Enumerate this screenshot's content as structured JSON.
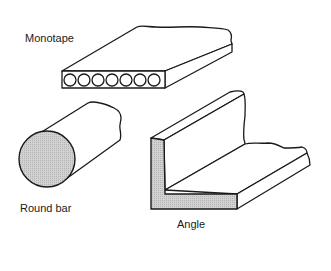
{
  "figure": {
    "items": [
      {
        "id": "monotape",
        "label": "Monotape",
        "tube_count": 7
      },
      {
        "id": "round-bar",
        "label": "Round bar"
      },
      {
        "id": "angle",
        "label": "Angle"
      }
    ]
  },
  "colors": {
    "line": "#1a1a1a",
    "section_fill": "#c8c8c8",
    "background": "#ffffff"
  }
}
